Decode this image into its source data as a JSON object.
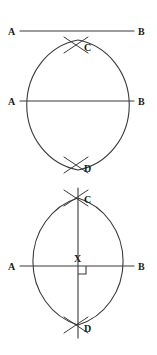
{
  "figure": {
    "background_color": "#ffffff",
    "stroke_color": "#3a3a3a",
    "label_color": "#1a1a1a",
    "width": 157,
    "height": 355
  },
  "panels": [
    {
      "id": "panel-1",
      "caption": "Given segment AB",
      "labels": {
        "left": "A",
        "right": "B"
      },
      "line": {
        "y": 31,
        "x1": 20,
        "x2": 134
      },
      "label_positions": {
        "left": {
          "x": 8,
          "y": 35
        },
        "right": {
          "x": 138,
          "y": 35
        }
      }
    },
    {
      "id": "panel-2",
      "caption": "Arcs from A and B intersect at C and D",
      "labels": {
        "left": "A",
        "right": "B",
        "top": "C",
        "bottom": "D"
      },
      "line": {
        "y": 101,
        "x1": 20,
        "x2": 134
      },
      "label_positions": {
        "left": {
          "x": 8,
          "y": 105
        },
        "right": {
          "x": 138,
          "y": 105
        },
        "top": {
          "x": 84,
          "y": 51
        },
        "bottom": {
          "x": 84,
          "y": 172
        }
      },
      "intersection_top": {
        "x": 78,
        "y": 45
      },
      "intersection_bottom": {
        "x": 78,
        "y": 165
      },
      "arc_left": {
        "x1": 78,
        "y1": 40,
        "x2": 78,
        "y2": 170,
        "rx": 62,
        "ry": 66,
        "sweep": 0
      },
      "arc_right": {
        "x1": 78,
        "y1": 40,
        "x2": 78,
        "y2": 170,
        "rx": 62,
        "ry": 66,
        "sweep": 1
      }
    },
    {
      "id": "panel-3",
      "caption": "Line CD is the perpendicular bisector meeting AB at X",
      "labels": {
        "left": "A",
        "right": "B",
        "top": "C",
        "bottom": "D",
        "foot": "X"
      },
      "line": {
        "y": 266,
        "x1": 20,
        "x2": 134
      },
      "label_positions": {
        "left": {
          "x": 8,
          "y": 270
        },
        "right": {
          "x": 138,
          "y": 270
        },
        "top": {
          "x": 84,
          "y": 203
        },
        "bottom": {
          "x": 84,
          "y": 332
        },
        "foot": {
          "x": 74,
          "y": 262
        }
      },
      "intersection_top": {
        "x": 78,
        "y": 198
      },
      "intersection_bottom": {
        "x": 78,
        "y": 325
      },
      "foot_point": {
        "x": 78,
        "y": 266
      },
      "vertical_line": {
        "x": 78,
        "y1": 188,
        "y2": 338
      },
      "right_angle_marker": {
        "x": 78,
        "y": 266,
        "size": 8
      },
      "arc_left": {
        "x1": 78,
        "y1": 198,
        "x2": 78,
        "y2": 325,
        "rx": 62,
        "ry": 66,
        "sweep": 0
      },
      "arc_right": {
        "x1": 78,
        "y1": 198,
        "x2": 78,
        "y2": 325,
        "rx": 62,
        "ry": 66,
        "sweep": 1
      }
    }
  ]
}
